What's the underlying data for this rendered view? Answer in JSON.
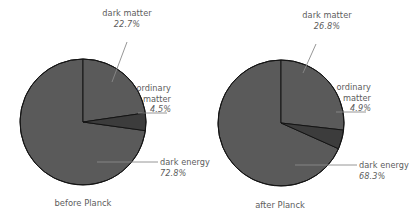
{
  "figure": {
    "background_color": "#ffffff",
    "text_color": "#5c5c5c",
    "slice_color": "#5a5a5a",
    "slice_color_alt": "#3c3c3c",
    "edge_color": "#141414"
  },
  "chart_data": [
    {
      "type": "pie",
      "title": "before Planck",
      "labels": [
        "dark matter",
        "ordinary matter",
        "dark energy"
      ],
      "values": [
        22.7,
        4.5,
        72.8
      ],
      "value_labels": [
        "22.7%",
        "4.5%",
        "72.8%"
      ],
      "start_angle": 90,
      "direction": "clockwise",
      "legend": "callout-labels",
      "grid": false
    },
    {
      "type": "pie",
      "title": "after Planck",
      "labels": [
        "dark matter",
        "ordinary matter",
        "dark energy"
      ],
      "values": [
        26.8,
        4.9,
        68.3
      ],
      "value_labels": [
        "26.8%",
        "4.9%",
        "68.3%"
      ],
      "start_angle": 90,
      "direction": "clockwise",
      "legend": "callout-labels",
      "grid": false
    }
  ],
  "left_chart": {
    "caption": "before Planck",
    "dark_matter": {
      "name": "dark matter",
      "pct": "22.7%"
    },
    "ordinary_matter": {
      "name_line1": "ordinary",
      "name_line2": "matter",
      "pct": "4.5%"
    },
    "dark_energy": {
      "name": "dark energy",
      "pct": "72.8%"
    }
  },
  "right_chart": {
    "caption": "after Planck",
    "dark_matter": {
      "name": "dark matter",
      "pct": "26.8%"
    },
    "ordinary_matter": {
      "name_line1": "ordinary",
      "name_line2": "matter",
      "pct": "4.9%"
    },
    "dark_energy": {
      "name": "dark energy",
      "pct": "68.3%"
    }
  }
}
